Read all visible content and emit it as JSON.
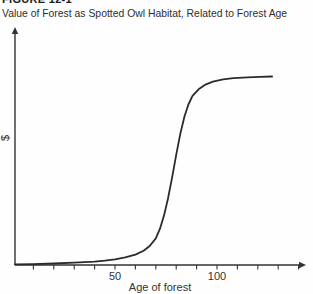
{
  "figure": {
    "label": "FIGURE 12-1",
    "title": "Value of Forest as Spotted Owl Habitat, Related to Forest Age"
  },
  "chart_data": {
    "type": "line",
    "title": "Value of Forest as Spotted Owl Habitat, Related to Forest Age",
    "xlabel": "Age of forest",
    "ylabel": "$",
    "xlim": [
      0,
      143
    ],
    "ylim": [
      0,
      100
    ],
    "grid": false,
    "legend": "none",
    "x_tick_interval": 10,
    "x_tick_ages": [
      10,
      20,
      30,
      40,
      50,
      60,
      70,
      80,
      90,
      100,
      110,
      120,
      130,
      140
    ],
    "x_labeled_ticks": [
      "50",
      "100"
    ],
    "x_labeled_tick_ages": [
      50,
      100
    ],
    "axis_color": "#333333",
    "curve_color": "#2b2b2b",
    "series": [
      {
        "name": "Habitat value ($, relative 0-100)",
        "x": [
          1,
          10,
          20,
          30,
          40,
          45,
          50,
          55,
          60,
          64,
          67,
          70,
          72,
          74,
          76,
          78,
          80,
          82,
          84,
          86,
          88,
          91,
          94,
          98,
          103,
          108,
          115,
          121,
          127
        ],
        "y": [
          0.3,
          0.5,
          0.8,
          1.2,
          1.8,
          2.3,
          3,
          4,
          5.5,
          7.5,
          10,
          14,
          19,
          26,
          35,
          46,
          58,
          69,
          78,
          84.5,
          89,
          92.5,
          94.8,
          96.5,
          97.7,
          98.3,
          98.8,
          99,
          99.2
        ]
      }
    ],
    "pixel_mapping": {
      "x0_px": 13,
      "px_per_year": 2.04,
      "y_base_px": 265,
      "px_per_unit": 1.9,
      "axis_origin_x": 15,
      "axis_y": 265,
      "x_axis_end": 298,
      "x_arrow_tip": 306,
      "y_axis_top": 34,
      "y_arrow_tip": 27,
      "tick_len": 4.5,
      "tick_label_y": 280,
      "xlabel_x": 160,
      "xlabel_y": 291,
      "ylabel_x": 9,
      "ylabel_y": 138
    }
  }
}
